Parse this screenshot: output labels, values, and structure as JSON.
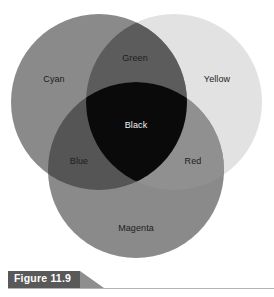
{
  "figure": {
    "caption_label": "Figure 11.9",
    "caption_bar_color": "#595959",
    "caption_tail_color": "#8e8e8e",
    "caption_rule_color": "#b5b5b5",
    "background_color": "#ffffff"
  },
  "diagram": {
    "type": "venn",
    "circle_radius": 88,
    "circles": [
      {
        "name": "cyan",
        "label": "Cyan",
        "cx": 99,
        "cy": 102,
        "fill": "#8a8a8a"
      },
      {
        "name": "yellow",
        "label": "Yellow",
        "cx": 174,
        "cy": 102,
        "fill": "#e2e2e2"
      },
      {
        "name": "magenta",
        "label": "Magenta",
        "cx": 136,
        "cy": 170,
        "fill": "#8a8a8a"
      }
    ],
    "overlaps": [
      {
        "name": "green",
        "label": "Green",
        "of": "cyan + yellow",
        "fill": "#5c5c5c"
      },
      {
        "name": "blue",
        "label": "Blue",
        "of": "cyan + magenta",
        "fill": "#555555"
      },
      {
        "name": "red",
        "label": "Red",
        "of": "yellow + magenta",
        "fill": "#909090"
      },
      {
        "name": "black",
        "label": "Black",
        "of": "cyan + yellow + magenta",
        "fill": "#0a0a0a"
      }
    ],
    "labels": {
      "cyan": "Cyan",
      "green": "Green",
      "yellow": "Yellow",
      "black": "Black",
      "blue": "Blue",
      "red": "Red",
      "magenta": "Magenta"
    }
  }
}
